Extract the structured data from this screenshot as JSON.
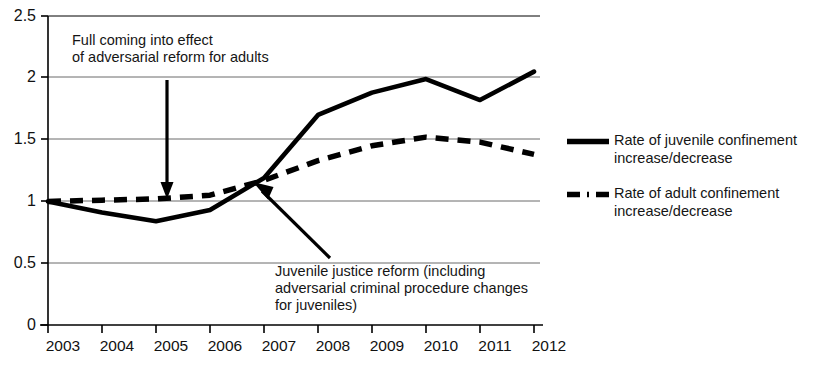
{
  "chart_data": {
    "type": "line",
    "title": "",
    "xlabel": "",
    "ylabel": "",
    "x": [
      "2003",
      "2004",
      "2005",
      "2006",
      "2007",
      "2008",
      "2009",
      "2010",
      "2011",
      "2012"
    ],
    "categories": [
      "2003",
      "2004",
      "2005",
      "2006",
      "2007",
      "2008",
      "2009",
      "2010",
      "2011",
      "2012"
    ],
    "ylim": [
      0,
      2.5
    ],
    "yticks": [
      "0",
      "0.5",
      "1",
      "1.5",
      "2",
      "2.5"
    ],
    "ytick_values": [
      0,
      0.5,
      1,
      1.5,
      2,
      2.5
    ],
    "grid": true,
    "legend_position": "right",
    "series": [
      {
        "name": "Rate of juvenile confinement increase/decrease",
        "style": "solid",
        "color": "#000000",
        "values": [
          1.0,
          0.91,
          0.84,
          0.93,
          1.19,
          1.7,
          1.88,
          1.99,
          1.82,
          2.05
        ]
      },
      {
        "name": "Rate of adult confinement increase/decrease",
        "style": "dashed",
        "color": "#000000",
        "values": [
          1.0,
          1.01,
          1.02,
          1.05,
          1.17,
          1.33,
          1.45,
          1.52,
          1.48,
          1.38
        ]
      }
    ],
    "annotations": [
      {
        "id": "adult-reform",
        "text": "Full coming into effect\nof adversarial reform for adults",
        "arrow": "down",
        "points_to_x": "2005",
        "points_to_y": 1.0
      },
      {
        "id": "juvenile-reform",
        "text": "Juvenile justice reform (including\nadversarial criminal procedure changes\nfor juveniles)",
        "arrow": "up-left",
        "points_to_x": "2007",
        "points_to_y": 1.18
      }
    ]
  },
  "legend": {
    "entries": [
      {
        "label": "Rate of juvenile confinement\nincrease/decrease",
        "style": "solid"
      },
      {
        "label": "Rate of adult confinement\nincrease/decrease",
        "style": "dashed"
      }
    ]
  },
  "axes": {
    "y_labels": [
      "2.5",
      "2",
      "1.5",
      "1",
      "0.5",
      "0"
    ],
    "x_labels": [
      "2003",
      "2004",
      "2005",
      "2006",
      "2007",
      "2008",
      "2009",
      "2010",
      "2011",
      "2012"
    ]
  },
  "annotations": {
    "adult_reform": "Full coming into effect\nof adversarial reform for adults",
    "juvenile_reform": "Juvenile justice reform (including\nadversarial criminal procedure changes\nfor juveniles)"
  }
}
